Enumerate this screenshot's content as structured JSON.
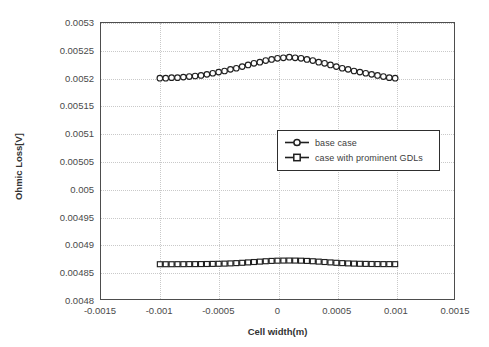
{
  "chart_data": {
    "type": "line",
    "title": "",
    "xlabel": "Cell width(m)",
    "ylabel": "Ohmic Loss[V]",
    "xlim": [
      -0.0015,
      0.0015
    ],
    "ylim": [
      0.0048,
      0.0053
    ],
    "grid": true,
    "legend_position": "center-right inside plot",
    "xticks": [
      "-0.0015",
      "-0.001",
      "-0.0005",
      "0",
      "0.0005",
      "0.001",
      "0.0015"
    ],
    "xtick_values": [
      -0.0015,
      -0.001,
      -0.0005,
      0,
      0.0005,
      0.001,
      0.0015
    ],
    "yticks": [
      "0.0048",
      "0.00485",
      "0.0049",
      "0.00495",
      "0.005",
      "0.00505",
      "0.0051",
      "0.00515",
      "0.0052",
      "0.00525",
      "0.0053"
    ],
    "ytick_values": [
      0.0048,
      0.00485,
      0.0049,
      0.00495,
      0.005,
      0.00505,
      0.0051,
      0.00515,
      0.0052,
      0.00525,
      0.0053
    ],
    "x": [
      -0.001,
      -0.00095,
      -0.0009,
      -0.00085,
      -0.0008,
      -0.00075,
      -0.0007,
      -0.00065,
      -0.0006,
      -0.00055,
      -0.0005,
      -0.00045,
      -0.0004,
      -0.00035,
      -0.0003,
      -0.00025,
      -0.0002,
      -0.00015,
      -0.0001,
      -5e-05,
      0,
      5e-05,
      0.0001,
      0.00015,
      0.0002,
      0.00025,
      0.0003,
      0.00035,
      0.0004,
      0.00045,
      0.0005,
      0.00055,
      0.0006,
      0.00065,
      0.0007,
      0.00075,
      0.0008,
      0.00085,
      0.0009,
      0.00095,
      0.001
    ],
    "series": [
      {
        "name": "base case",
        "marker": "circle",
        "values": [
          0.0052,
          0.0052,
          0.005201,
          0.005201,
          0.005202,
          0.005203,
          0.005204,
          0.005205,
          0.005207,
          0.005209,
          0.005211,
          0.005213,
          0.005216,
          0.005218,
          0.005221,
          0.005224,
          0.005227,
          0.005229,
          0.005232,
          0.005234,
          0.005236,
          0.005237,
          0.005238,
          0.005237,
          0.005236,
          0.005234,
          0.005232,
          0.005229,
          0.005227,
          0.005224,
          0.005221,
          0.005218,
          0.005216,
          0.005213,
          0.005211,
          0.005209,
          0.005207,
          0.005205,
          0.005203,
          0.005201,
          0.0052
        ]
      },
      {
        "name": "case with prominent GDLs",
        "marker": "square",
        "values": [
          0.004863,
          0.004863,
          0.004863,
          0.0048631,
          0.0048631,
          0.0048632,
          0.0048632,
          0.0048633,
          0.0048634,
          0.0048636,
          0.0048638,
          0.0048641,
          0.0048645,
          0.004865,
          0.0048656,
          0.0048663,
          0.004867,
          0.0048677,
          0.0048684,
          0.004869,
          0.0048694,
          0.0048696,
          0.0048697,
          0.0048696,
          0.0048694,
          0.004869,
          0.0048684,
          0.0048677,
          0.004867,
          0.0048663,
          0.0048656,
          0.004865,
          0.0048645,
          0.0048641,
          0.0048638,
          0.0048636,
          0.0048634,
          0.0048633,
          0.0048632,
          0.0048632,
          0.0048631
        ]
      }
    ]
  },
  "legend": {
    "items": [
      {
        "label": "base case"
      },
      {
        "label": "case with prominent GDLs"
      }
    ]
  },
  "axes": {
    "x_title": "Cell width(m)",
    "y_title": "Ohmic Loss[V]"
  }
}
